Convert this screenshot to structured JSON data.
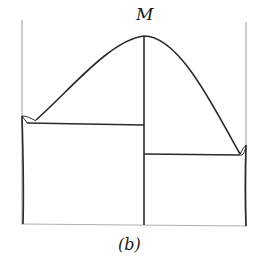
{
  "diagram": {
    "type": "binary-phase-diagram",
    "labels": {
      "maximum": "M",
      "caption": "(b)"
    },
    "colors": {
      "line": "#2a2a2a",
      "frame": "#8a8a8a",
      "background": "#ffffff"
    }
  }
}
